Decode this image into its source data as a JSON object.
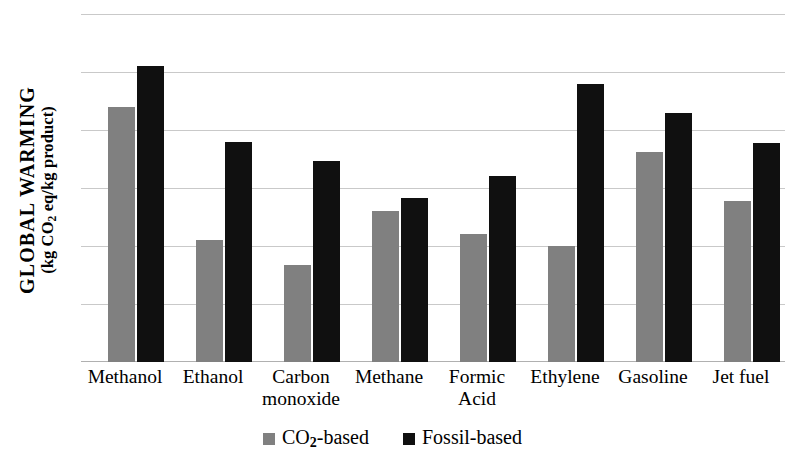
{
  "chart_data": {
    "type": "bar",
    "title": "",
    "subtitle": "",
    "xlabel": "",
    "ylabel": "GLOBAL WARMING (kg CO2 eq/kg product)",
    "ylabel_line1": "GLOBAL WARMING",
    "ylabel_line2_prefix": "(kg CO",
    "ylabel_line2_sub": "2",
    "ylabel_line2_suffix": " eq/kg product)",
    "categories": [
      "Methanol",
      "Ethanol",
      "Carbon monoxide",
      "Methane",
      "Formic Acid",
      "Ethylene",
      "Gasoline",
      "Jet fuel"
    ],
    "category_lines": [
      [
        "Methanol"
      ],
      [
        "Ethanol"
      ],
      [
        "Carbon",
        "monoxide"
      ],
      [
        "Methane"
      ],
      [
        "Formic",
        "Acid"
      ],
      [
        "Ethylene"
      ],
      [
        "Gasoline"
      ],
      [
        "Jet fuel"
      ]
    ],
    "series": [
      {
        "name": "CO2-based",
        "name_prefix": "CO",
        "name_sub": "2",
        "name_suffix": "-based",
        "color": "#808080",
        "values": [
          4.4,
          2.1,
          1.67,
          2.6,
          2.2,
          2.0,
          3.62,
          2.78
        ]
      },
      {
        "name": "Fossil-based",
        "name_prefix": "Fossil-based",
        "name_sub": "",
        "name_suffix": "",
        "color": "#101010",
        "values": [
          5.1,
          3.8,
          3.47,
          2.82,
          3.2,
          4.8,
          4.3,
          3.78
        ]
      }
    ],
    "ylim": [
      0,
      6
    ],
    "y_ticks": [
      0,
      1,
      2,
      3,
      4,
      5,
      6
    ],
    "y_tick_labels": [
      "0",
      "1",
      "2",
      "3",
      "4",
      "5",
      "6"
    ],
    "grid": true,
    "grid_color": "#c9c9c9",
    "legend_position": "bottom"
  }
}
